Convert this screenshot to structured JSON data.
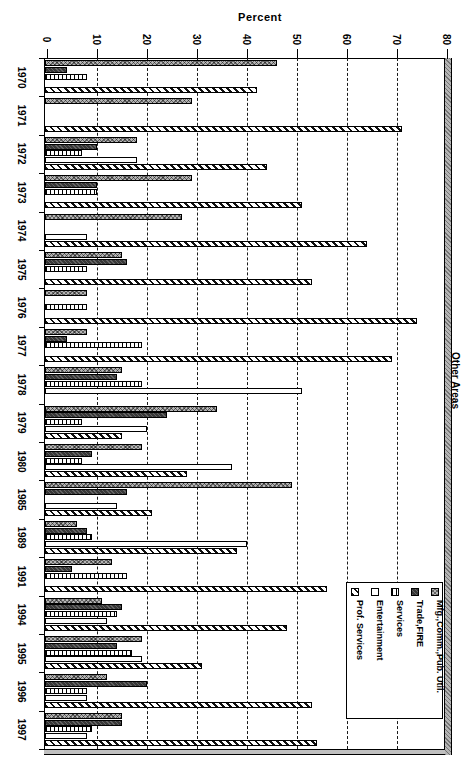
{
  "chart_data": {
    "type": "bar",
    "orientation": "horizontal",
    "rotated_presentation": "entire chart is rotated 90 degrees clockwise (portrait scan of a landscape column chart)",
    "title": "Other Areas",
    "value_axis_label": "Percent",
    "value_ticks": [
      0,
      10,
      20,
      30,
      40,
      50,
      60,
      70,
      80
    ],
    "value_range": [
      0,
      80
    ],
    "grid": "dashed gridline at every 10 percent",
    "legend_position": "lower-right box, entries rotated",
    "categories": [
      "1970",
      "1971",
      "1972",
      "1973",
      "1974",
      "1975",
      "1976",
      "1977",
      "1978",
      "1979",
      "1980",
      "1985",
      "1989",
      "1991",
      "1994",
      "1995",
      "1996",
      "1997"
    ],
    "series": [
      {
        "name": "Mfg.,Comm.,Pub. Util.",
        "pattern": "gray-checker",
        "values": [
          46,
          29,
          18,
          29,
          27,
          15,
          8,
          8,
          15,
          34,
          19,
          49,
          6,
          13,
          11,
          19,
          12,
          15
        ]
      },
      {
        "name": "Trade,FIRE",
        "pattern": "dark-solid",
        "values": [
          4,
          0,
          10,
          10,
          0,
          16,
          0,
          4,
          14,
          24,
          9,
          16,
          8,
          5,
          15,
          14,
          20,
          15
        ]
      },
      {
        "name": "Services",
        "pattern": "vertical-stripes",
        "values": [
          8,
          0,
          7,
          10,
          0,
          8,
          8,
          19,
          19,
          7,
          7,
          0,
          9,
          16,
          14,
          17,
          8,
          9
        ]
      },
      {
        "name": "Entertainment",
        "pattern": "white",
        "values": [
          0,
          0,
          18,
          0,
          8,
          0,
          0,
          0,
          51,
          20,
          37,
          14,
          40,
          0,
          12,
          19,
          8,
          8
        ]
      },
      {
        "name": "Prof. Services",
        "pattern": "diagonal-hatch",
        "values": [
          42,
          71,
          44,
          51,
          64,
          53,
          74,
          69,
          0,
          15,
          28,
          21,
          38,
          56,
          48,
          31,
          53,
          54
        ]
      }
    ]
  },
  "legend": {
    "items": [
      {
        "label": "Mfg.,Comm.,Pub. Util.",
        "marker": "gray-checker-swatch"
      },
      {
        "label": "Trade,FIRE",
        "marker": "dark-solid-swatch"
      },
      {
        "label": "Services",
        "marker": "vertical-stripes-swatch"
      },
      {
        "label": "Entertainment",
        "marker": "white-swatch"
      },
      {
        "label": "Prof. Services",
        "marker": "diagonal-hatch-swatch"
      }
    ]
  },
  "colors": {
    "background": "#ffffff",
    "ink": "#000000",
    "gray_fill": "#b4b4b4",
    "dark_fill": "#383838"
  }
}
